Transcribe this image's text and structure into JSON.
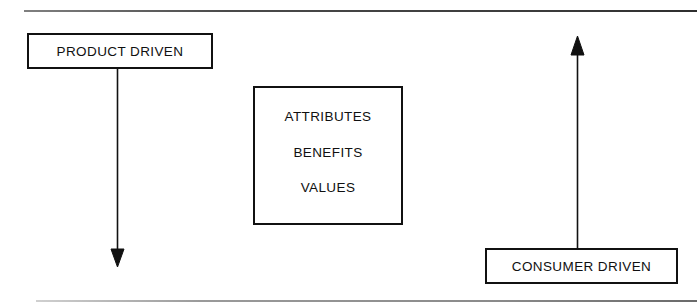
{
  "figure": {
    "background_color": "#ffffff",
    "line_color": "#111111",
    "rules": {
      "top_label": "top-divider-rule",
      "bottom_label": "bottom-divider-rule"
    }
  },
  "nodes": {
    "product_driven": {
      "label": "PRODUCT DRIVEN"
    },
    "consumer_driven": {
      "label": "CONSUMER DRIVEN"
    },
    "ladder": {
      "items": [
        {
          "label": "ATTRIBUTES"
        },
        {
          "label": "BENEFITS"
        },
        {
          "label": "VALUES"
        }
      ]
    }
  },
  "arrows": {
    "downward": {
      "name": "product-driven-down-arrow",
      "direction": "down"
    },
    "upward": {
      "name": "consumer-driven-up-arrow",
      "direction": "up"
    }
  }
}
